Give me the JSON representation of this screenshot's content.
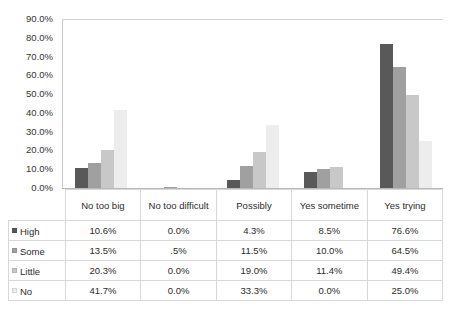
{
  "chart_data": {
    "type": "bar",
    "title": "",
    "xlabel": "",
    "ylabel": "",
    "ylim": [
      0,
      90
    ],
    "grid": false,
    "legend_position": "table-left",
    "categories": [
      "No too big",
      "No too difficult",
      "Possibly",
      "Yes sometime",
      "Yes trying"
    ],
    "ytick_labels": [
      "90.0%",
      "80.0%",
      "70.0%",
      "60.0%",
      "50.0%",
      "40.0%",
      "30.0%",
      "20.0%",
      "10.0%",
      "0.0%"
    ],
    "ytick_values": [
      90,
      80,
      70,
      60,
      50,
      40,
      30,
      20,
      10,
      0
    ],
    "series": [
      {
        "name": "High",
        "color": "#595959",
        "values": [
          10.6,
          0.0,
          4.3,
          8.5,
          76.6
        ],
        "labels": [
          "10.6%",
          "0.0%",
          "4.3%",
          "8.5%",
          "76.6%"
        ]
      },
      {
        "name": "Some",
        "color": "#a0a0a0",
        "values": [
          13.5,
          0.5,
          11.5,
          10.0,
          64.5
        ],
        "labels": [
          "13.5%",
          ".5%",
          "11.5%",
          "10.0%",
          "64.5%"
        ]
      },
      {
        "name": "Little",
        "color": "#c8c8c8",
        "values": [
          20.3,
          0.0,
          19.0,
          11.4,
          49.4
        ],
        "labels": [
          "20.3%",
          "0.0%",
          "19.0%",
          "11.4%",
          "49.4%"
        ]
      },
      {
        "name": "No",
        "color": "#ededed",
        "values": [
          41.7,
          0.0,
          33.3,
          0.0,
          25.0
        ],
        "labels": [
          "41.7%",
          "0.0%",
          "33.3%",
          "0.0%",
          "25.0%"
        ]
      }
    ]
  }
}
